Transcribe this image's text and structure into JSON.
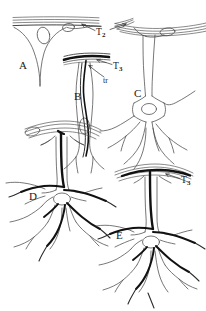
{
  "figure": {
    "background_color": "#ffffff",
    "ink_color": "#1a1a1a",
    "light_ink_color": "#555555",
    "panels": [
      {
        "id": "A",
        "label": "A",
        "description": "Elongated tapering glial cell with broad unstained end-foot spreading along a multi-layered membrane at top; two oval nuclei visible beneath membrane."
      },
      {
        "id": "B",
        "label": "B",
        "description": "Slender bipolar glial cell with heavily stained dark horizontal end-foot band at top, a dark longitudinal fibre (tr) running down through the cell body, and an oval nucleus."
      },
      {
        "id": "C",
        "label": "C",
        "description": "Unstained (outline only) multipolar astrocyte with branching processes and a vascular end-foot applied to the membrane at upper right."
      },
      {
        "id": "D",
        "label": "D",
        "description": "Multipolar astrocyte with heavily stained dark neurofibrillar processes radiating from the perinuclear region, and a dark end-foot on the arched membrane above."
      },
      {
        "id": "E",
        "label": "E",
        "description": "Multipolar astrocyte similar to D with dark stained processes and a prominent dark end-foot attached to the arched membrane at top."
      }
    ],
    "annotations": [
      {
        "id": "T2",
        "text": "T",
        "subscript": "2",
        "full_text": "T2",
        "target_panel": "A",
        "description": "Arrow label pointing to the membrane / end-foot contact in panel A and to the membrane of panel C"
      },
      {
        "id": "T3-b",
        "text": "T",
        "subscript": "3",
        "full_text": "T3",
        "target_panel": "B",
        "description": "Arrow label pointing to the dark stained end-foot band of panel B"
      },
      {
        "id": "tr",
        "text": "tr",
        "subscript": "",
        "full_text": "tr",
        "target_panel": "B",
        "description": "Arrow label pointing to the dark longitudinal fibre (trabecula) within the cell of panel B"
      },
      {
        "id": "T3-e",
        "text": "T",
        "subscript": "3",
        "full_text": "T3",
        "target_panel": "E",
        "description": "Arrow label pointing to the dark stained end-foot of panel E"
      }
    ]
  }
}
